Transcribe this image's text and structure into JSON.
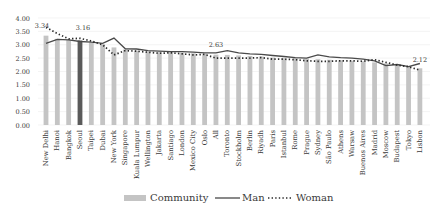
{
  "chart_data": {
    "type": "bar",
    "title": "",
    "xlabel": "",
    "ylabel": "",
    "ylim": [
      0,
      4
    ],
    "yticks": [
      "0.00",
      "0.50",
      "1.00",
      "1.50",
      "2.00",
      "2.50",
      "3.00",
      "3.50",
      "4.00"
    ],
    "grid": true,
    "legend_position": "bottom",
    "categories": [
      "New Delhi",
      "Hanoi",
      "Bangkok",
      "Seoul",
      "Taipei",
      "Dubai",
      "New York",
      "Singapore",
      "Kuala Lumpur",
      "Wellington",
      "Jakarta",
      "Santiago",
      "London",
      "Mexico City",
      "Oslo",
      "All",
      "Toronto",
      "Stockholm",
      "Berlin",
      "Riyadh",
      "Paris",
      "Istanbul",
      "Rome",
      "Prague",
      "Sydney",
      "São Paulo",
      "Athens",
      "Warsaw",
      "Buenos Aires",
      "Madrid",
      "Moscow",
      "Budapest",
      "Tokyo",
      "Lisbon"
    ],
    "highlight_index": 3,
    "series": [
      {
        "name": "Community",
        "kind": "bar",
        "color": "#c4c4c4",
        "highlight_color": "#5a5a5a",
        "values": [
          3.34,
          3.22,
          3.18,
          3.16,
          3.08,
          3.02,
          2.9,
          2.82,
          2.78,
          2.74,
          2.72,
          2.72,
          2.7,
          2.68,
          2.66,
          2.63,
          2.62,
          2.6,
          2.58,
          2.56,
          2.52,
          2.5,
          2.5,
          2.48,
          2.46,
          2.44,
          2.42,
          2.4,
          2.38,
          2.34,
          2.3,
          2.24,
          2.18,
          2.12
        ]
      },
      {
        "name": "Man",
        "kind": "line",
        "color": "#4a4a4a",
        "values": [
          3.05,
          3.2,
          3.18,
          3.12,
          3.1,
          3.05,
          3.25,
          2.85,
          2.84,
          2.78,
          2.76,
          2.74,
          2.74,
          2.72,
          2.7,
          2.7,
          2.78,
          2.7,
          2.66,
          2.64,
          2.6,
          2.56,
          2.52,
          2.5,
          2.62,
          2.55,
          2.52,
          2.5,
          2.46,
          2.4,
          2.22,
          2.26,
          2.18,
          2.3
        ]
      },
      {
        "name": "Woman",
        "kind": "dotted-line",
        "color": "#2a2a2a",
        "values": [
          3.65,
          3.42,
          3.22,
          3.24,
          3.14,
          3.0,
          2.62,
          2.78,
          2.76,
          2.72,
          2.68,
          2.7,
          2.66,
          2.62,
          2.64,
          2.5,
          2.5,
          2.5,
          2.5,
          2.52,
          2.46,
          2.46,
          2.44,
          2.4,
          2.38,
          2.38,
          2.4,
          2.4,
          2.38,
          2.44,
          2.34,
          2.24,
          2.18,
          2.05
        ]
      }
    ],
    "annotations": [
      {
        "index": 0,
        "text": "3.34"
      },
      {
        "index": 3,
        "text": "3.16"
      },
      {
        "index": 15,
        "text": "2.63"
      },
      {
        "index": 33,
        "text": "2.12"
      }
    ]
  },
  "legend": {
    "items": [
      {
        "label": "Community",
        "symbol": "bar"
      },
      {
        "label": "Man",
        "symbol": "line"
      },
      {
        "label": "Woman",
        "symbol": "dotted"
      }
    ]
  }
}
